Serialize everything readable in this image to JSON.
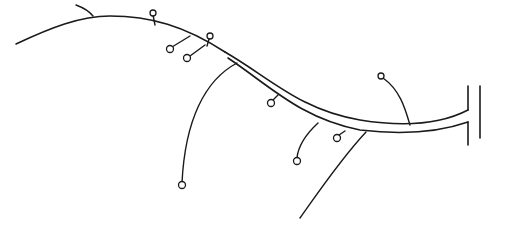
{
  "diagram": {
    "colors": {
      "background": "#ffffff",
      "ink": "#1a1a1a"
    },
    "main_stem": {
      "single_line_path": "M 16 44 C 50 28, 80 16, 110 16 C 150 16, 185 26, 225 52",
      "tube_upper_path": "M 225 52 C 270 78, 300 110, 360 120 C 410 128, 445 122, 468 110",
      "tube_lower_path": "M 228 58 C 270 86, 300 118, 360 130 C 410 136, 445 130, 468 122",
      "stroke_width": 1.6
    },
    "terminal": {
      "flare_top": "M 468 110 L 468 86",
      "flare_bottom": "M 468 122 L 468 145",
      "bar_x": 480,
      "bar_y1": 86,
      "bar_y2": 138
    },
    "spur": {
      "path": "M 76 5 C 84 8, 90 12, 93 16"
    },
    "branches": [
      {
        "name": "branch-long-left",
        "path": "M 237 63 C 205 80, 185 120, 182 183",
        "has_node": true,
        "node": {
          "cx": 182,
          "cy": 185,
          "r": 3.5
        }
      },
      {
        "name": "branch-long-bottom",
        "path": "M 366 132 C 340 160, 320 190, 300 218",
        "has_node": false
      },
      {
        "name": "branch-top-1",
        "path": "M 155 25 L 153 15",
        "has_node": true,
        "node": {
          "cx": 153,
          "cy": 13,
          "r": 3
        }
      },
      {
        "name": "branch-top-2",
        "path": "M 190 36 L 172 47",
        "has_node": true,
        "node": {
          "cx": 170,
          "cy": 49,
          "r": 3.5
        }
      },
      {
        "name": "branch-top-3",
        "path": "M 207 46 L 209 39",
        "has_node": true,
        "node": {
          "cx": 210,
          "cy": 36,
          "r": 3
        }
      },
      {
        "name": "branch-top-4",
        "path": "M 205 45 L 190 56",
        "has_node": true,
        "node": {
          "cx": 187,
          "cy": 58,
          "r": 3.5
        }
      },
      {
        "name": "branch-mid-1",
        "path": "M 278 95 L 273 100",
        "has_node": true,
        "node": {
          "cx": 271,
          "cy": 103,
          "r": 3.5
        }
      },
      {
        "name": "branch-mid-2",
        "path": "M 318 123 C 305 135, 298 148, 297 158",
        "has_node": true,
        "node": {
          "cx": 297,
          "cy": 161,
          "r": 3.5
        }
      },
      {
        "name": "branch-mid-3",
        "path": "M 345 131 L 339 135",
        "has_node": true,
        "node": {
          "cx": 337,
          "cy": 138,
          "r": 3.5
        }
      },
      {
        "name": "branch-right",
        "path": "M 410 125 C 405 108, 400 90, 383 78",
        "has_node": true,
        "node": {
          "cx": 381,
          "cy": 76,
          "r": 3
        }
      }
    ]
  }
}
